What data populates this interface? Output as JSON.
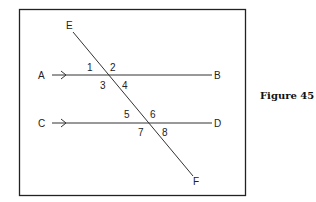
{
  "figure": {
    "caption": "Figure 45",
    "points": {
      "A": "A",
      "B": "B",
      "C": "C",
      "D": "D",
      "E": "E",
      "F": "F"
    },
    "angles": [
      "1",
      "2",
      "3",
      "4",
      "5",
      "6",
      "7",
      "8"
    ],
    "lines": [
      {
        "name": "AB",
        "type": "parallel",
        "arrow": "right"
      },
      {
        "name": "CD",
        "type": "parallel",
        "arrow": "right"
      },
      {
        "name": "EF",
        "type": "transversal"
      }
    ]
  }
}
